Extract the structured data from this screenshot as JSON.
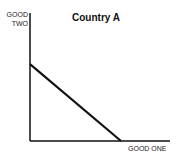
{
  "chart_data": {
    "type": "line",
    "title": "Country A",
    "xlabel": "GOOD ONE",
    "ylabel_line1": "GOOD",
    "ylabel_line2": "TWO",
    "series": [
      {
        "name": "Production Possibilities Frontier",
        "points": [
          [
            0,
            60
          ],
          [
            70,
            0
          ]
        ]
      }
    ],
    "xlim": [
      0,
      100
    ],
    "ylim": [
      0,
      100
    ],
    "grid": false,
    "ticks": false
  }
}
